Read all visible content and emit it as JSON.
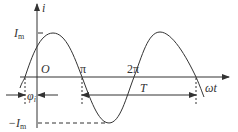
{
  "diagram": {
    "type": "sinusoidal-current-graph",
    "y_axis_label": "i",
    "x_axis_label": "ωt",
    "origin_label": "O",
    "amplitude_label": "I",
    "amplitude_sub": "m",
    "neg_amplitude_label": "−I",
    "neg_amplitude_sub": "m",
    "phase_label": "φ",
    "phase_sub": "i",
    "pi_label": "π",
    "two_pi_label": "2π",
    "period_label": "T",
    "colors": {
      "stroke": "#333333",
      "background": "#ffffff"
    }
  }
}
